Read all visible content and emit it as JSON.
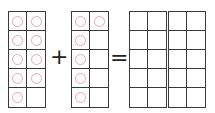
{
  "equation": {
    "operator_plus": "+",
    "operator_equals": "="
  },
  "frames": [
    {
      "name": "ten-frame-addend-1",
      "counters": [
        1,
        1,
        1,
        1,
        1,
        1,
        1,
        1,
        1,
        0
      ],
      "count": 9
    },
    {
      "name": "ten-frame-addend-2",
      "counters": [
        1,
        1,
        1,
        0,
        1,
        0,
        1,
        0,
        1,
        0
      ],
      "count": 6
    },
    {
      "name": "ten-frame-sum-1",
      "counters": [
        0,
        0,
        0,
        0,
        0,
        0,
        0,
        0,
        0,
        0
      ],
      "count": 0
    },
    {
      "name": "ten-frame-sum-2",
      "counters": [
        0,
        0,
        0,
        0,
        0,
        0,
        0,
        0,
        0,
        0
      ],
      "count": 0
    }
  ],
  "colors": {
    "grid_line": "#3a3a3a",
    "counter": "#e7a6bd"
  }
}
